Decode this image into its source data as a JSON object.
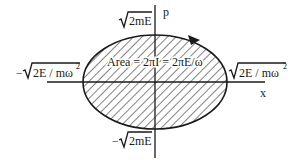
{
  "diagram": {
    "type": "phase-space-ellipse",
    "axes": {
      "x_label": "x",
      "p_label": "p"
    },
    "labels": {
      "p_max": "2mE",
      "p_min_prefix": "−",
      "p_min": "2mE",
      "x_max": "2E / mω",
      "x_max_exp": "2",
      "x_min_prefix": "−",
      "x_min": "2E / mω",
      "x_min_exp": "2",
      "area": "Area = 2πI = 2πE/ω"
    },
    "colors": {
      "stroke": "#1a1a1a",
      "background": "#ffffff"
    }
  }
}
